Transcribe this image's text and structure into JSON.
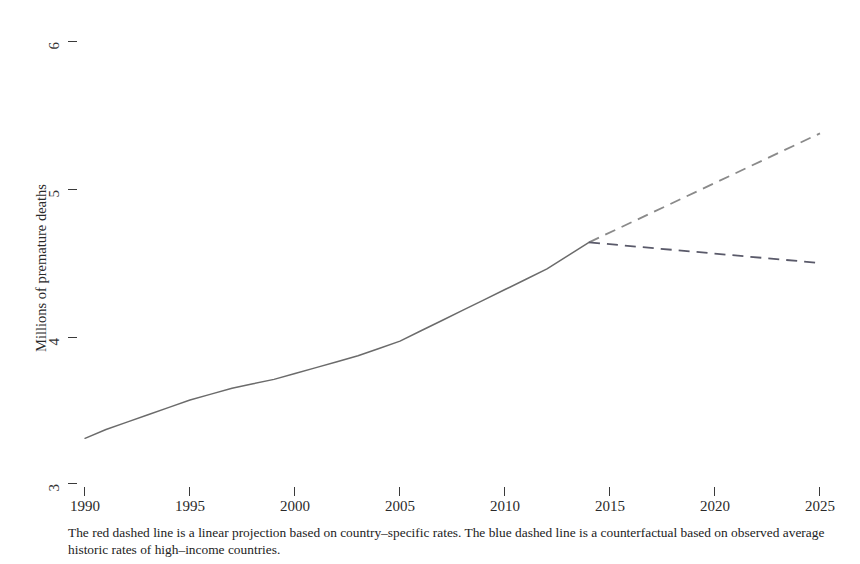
{
  "chart_data": {
    "type": "line",
    "title": "",
    "xlabel": "",
    "ylabel": "Millions of premature deaths",
    "xlim": [
      1990,
      2025
    ],
    "ylim": [
      3,
      6
    ],
    "xticks": [
      1990,
      1995,
      2000,
      2005,
      2010,
      2015,
      2020,
      2025
    ],
    "xticklabels": [
      "1990",
      "1995",
      "2000",
      "2005",
      "2010",
      "2015",
      "2020",
      "2025"
    ],
    "yticks": [
      3,
      4,
      5,
      6
    ],
    "yticklabels": [
      "3",
      "4",
      "5",
      "6"
    ],
    "grid": false,
    "legend": "none",
    "series": [
      {
        "name": "Observed premature deaths",
        "style": "solid",
        "color": "#6b6b6b",
        "x": [
          1990,
          1991,
          1992,
          1993,
          1994,
          1995,
          1996,
          1997,
          1998,
          1999,
          2000,
          2001,
          2002,
          2003,
          2004,
          2005,
          2006,
          2007,
          2008,
          2009,
          2010,
          2011,
          2012,
          2013,
          2014
        ],
        "y": [
          3.31,
          3.37,
          3.42,
          3.47,
          3.52,
          3.57,
          3.61,
          3.65,
          3.68,
          3.71,
          3.75,
          3.79,
          3.83,
          3.87,
          3.92,
          3.97,
          4.04,
          4.11,
          4.18,
          4.25,
          4.32,
          4.39,
          4.46,
          4.55,
          4.64
        ]
      },
      {
        "name": "Linear projection based on country-specific rates",
        "style": "dashed",
        "color": "#8a8a8a",
        "annotation": "red dashed line",
        "x": [
          2014,
          2025
        ],
        "y": [
          4.64,
          5.38
        ]
      },
      {
        "name": "Counterfactual based on high-income country historic rates",
        "style": "dashed",
        "color": "#5a5a6a",
        "annotation": "blue dashed line",
        "x": [
          2014,
          2025
        ],
        "y": [
          4.64,
          4.5
        ]
      }
    ],
    "footnote": "The red dashed line is a linear projection based on country–specific rates. The blue dashed line is a counterfactual based on observed average historic rates of high–income countries.",
    "colors": {
      "observed_line": "#6b6b6b",
      "projection_line": "#8a8a8a",
      "counterfactual_line": "#5a5a6a",
      "axis": "#3a3a3a",
      "text": "#2a2a2a",
      "background": "#ffffff"
    }
  }
}
